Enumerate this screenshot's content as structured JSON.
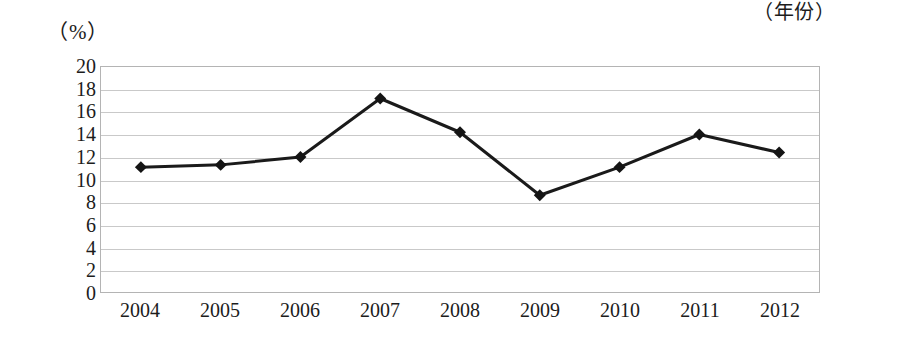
{
  "chart_data": {
    "type": "line",
    "title": "",
    "subtitle": "",
    "xlabel": "（年份）",
    "ylabel": "（%）",
    "categories": [
      "2004",
      "2005",
      "2006",
      "2007",
      "2008",
      "2009",
      "2010",
      "2011",
      "2012"
    ],
    "values": [
      11.1,
      11.3,
      12.0,
      17.2,
      14.2,
      8.6,
      11.1,
      14.0,
      12.4
    ],
    "series": [
      {
        "name": "",
        "values": [
          11.1,
          11.3,
          12.0,
          17.2,
          14.2,
          8.6,
          11.1,
          14.0,
          12.4
        ]
      }
    ],
    "ylim": [
      0,
      20
    ],
    "y_ticks": [
      0,
      2,
      4,
      6,
      8,
      10,
      12,
      14,
      16,
      18,
      20
    ],
    "y_tick_labels": [
      "0",
      "2",
      "4",
      "6",
      "8",
      "10",
      "12",
      "14",
      "16",
      "18",
      "20"
    ],
    "grid": true,
    "grid_axis": "y",
    "legend": false,
    "legend_position": "none",
    "marker": "diamond",
    "line_color": "#1a1a1a",
    "marker_color": "#141414",
    "grid_color": "#c9c9c9",
    "frame_color": "#b4b4b4",
    "annotations": []
  },
  "axes": {
    "unit_label": "（%）",
    "x_axis_title": "（年份）"
  }
}
